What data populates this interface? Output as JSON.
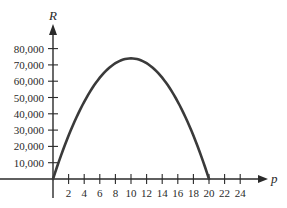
{
  "chart_data": {
    "type": "line",
    "title": "",
    "xlabel": "p",
    "ylabel": "R",
    "xlim": [
      0,
      26
    ],
    "ylim": [
      0,
      85000
    ],
    "grid": false,
    "legend": null,
    "x_ticks": [
      2,
      4,
      6,
      8,
      10,
      12,
      14,
      16,
      18,
      20,
      22,
      24
    ],
    "x_tick_labels": [
      "2",
      "4",
      "6",
      "8",
      "10",
      "12",
      "14",
      "16",
      "18",
      "20",
      "22",
      "24"
    ],
    "y_ticks": [
      10000,
      20000,
      30000,
      40000,
      50000,
      60000,
      70000,
      80000
    ],
    "y_tick_labels": [
      "10,000",
      "20,000",
      "30,000",
      "40,000",
      "50,000",
      "60,000",
      "70,000",
      "80,000"
    ],
    "series": [
      {
        "name": "R(p)",
        "x": [
          0,
          2,
          4,
          6,
          8,
          10,
          12,
          14,
          16,
          18,
          20
        ],
        "values": [
          0,
          26640,
          47360,
          62160,
          71040,
          74000,
          71040,
          62160,
          47360,
          26640,
          0
        ]
      }
    ],
    "annotations": []
  },
  "colors": {
    "curve": "#3a3a3a",
    "axis": "#2a2a2a",
    "background": "#ffffff"
  }
}
